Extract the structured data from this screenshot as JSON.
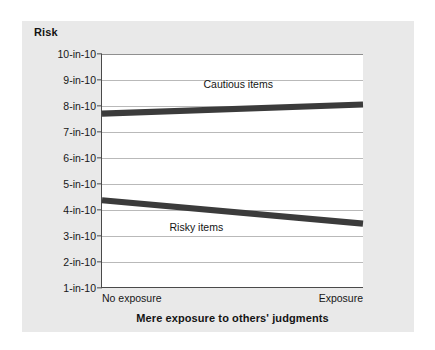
{
  "chart_data": {
    "type": "line",
    "title": "",
    "xlabel": "Mere exposure to others' judgments",
    "ylabel": "Risk",
    "categories": [
      "No exposure",
      "Exposure"
    ],
    "x_tick_labels": [
      "No exposure",
      "Exposure"
    ],
    "y_tick_labels": [
      "1-in-10",
      "2-in-10",
      "3-in-10",
      "4-in-10",
      "5-in-10",
      "6-in-10",
      "7-in-10",
      "8-in-10",
      "9-in-10",
      "10-in-10"
    ],
    "y_tick_values": [
      1,
      2,
      3,
      4,
      5,
      6,
      7,
      8,
      9,
      10
    ],
    "ylim": [
      1,
      10
    ],
    "grid": true,
    "legend_position": "inline-labels",
    "series": [
      {
        "name": "Cautious items",
        "values": [
          7.7,
          8.05
        ],
        "color": "#3b3b3b",
        "label_x_frac": 0.52,
        "label_y_value": 8.85
      },
      {
        "name": "Risky items",
        "values": [
          4.35,
          3.45
        ],
        "color": "#3b3b3b",
        "label_x_frac": 0.36,
        "label_y_value": 3.35
      }
    ],
    "annotations": [
      "Cautious items",
      "Risky items"
    ]
  },
  "figure": {
    "y_axis_title": "Risk",
    "x_axis_title": "Mere exposure to others' judgments",
    "x_left_label": "No exposure",
    "x_right_label": "Exposure",
    "card_background": "#e9e9e9",
    "plot_background": "#ffffff",
    "axis_color": "#4a4a4a",
    "gridline_color": "#b9b9b9",
    "series_color": "#3b3b3b",
    "text_color": "#141414"
  }
}
